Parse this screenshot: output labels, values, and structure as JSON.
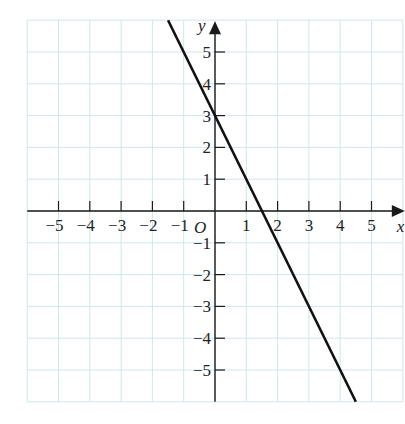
{
  "chart_data": {
    "type": "line",
    "title": "",
    "xlabel": "x",
    "ylabel": "y",
    "origin_label": "O",
    "xlim": [
      -6,
      6
    ],
    "ylim": [
      -6,
      6
    ],
    "grid": true,
    "x_ticks": [
      -5,
      -4,
      -3,
      -2,
      -1,
      1,
      2,
      3,
      4,
      5
    ],
    "x_tick_labels": [
      "−5",
      "−4",
      "−3",
      "−2",
      "−1",
      "1",
      "2",
      "3",
      "4",
      "5"
    ],
    "y_ticks": [
      5,
      4,
      3,
      2,
      1,
      -1,
      -2,
      -3,
      -4,
      -5
    ],
    "y_tick_labels": [
      "5",
      "4",
      "3",
      "2",
      "1",
      "−1",
      "−2",
      "−3",
      "−4",
      "−5"
    ],
    "series": [
      {
        "name": "y = -2x + 3",
        "slope": -2,
        "intercept": 3,
        "x": [
          -1.5,
          0,
          1.5,
          4.5
        ],
        "y": [
          6,
          3,
          0,
          -6
        ]
      }
    ],
    "legend": null
  },
  "colors": {
    "grid": "#cfe6ee",
    "axis": "#1a1a1a",
    "line": "#111111"
  }
}
